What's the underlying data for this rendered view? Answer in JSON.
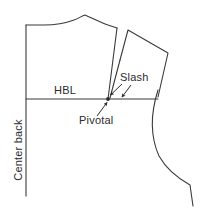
{
  "figure": {
    "type": "technical-pattern-drawing",
    "background_color": "#ffffff",
    "line_color": "#3a3a3a",
    "text_color": "#2b2b2b"
  },
  "labels": {
    "hbl": "HBL",
    "slash": "Slash",
    "pivotal": "Pivotal",
    "center_back": "Center back"
  },
  "geometry": {
    "center_back_line": {
      "x": 26,
      "y_top": 25,
      "y_bottom": 196
    },
    "hbl_line": {
      "y": 99,
      "x_start": 26,
      "x_end": 158
    },
    "pivot_point": {
      "x": 108,
      "y": 99
    },
    "main_piece_outline": "26,99 26,25 44,25 58,24 72,21 85,16 100,22 117,28 108,99",
    "rotated_piece_outline": "128,30 168,53 158,97 120,60",
    "side_seam_path": "158,90 C 150,118 151,140 160,158 C 172,174 182,180 190,185 L 193,205"
  },
  "arrows": [
    {
      "name": "slash-arrow-left",
      "from": [
        121,
        84
      ],
      "to": [
        110,
        95
      ]
    },
    {
      "name": "slash-arrow-right",
      "from": [
        130,
        86
      ],
      "to": [
        121,
        97
      ]
    },
    {
      "name": "pivotal-arrow",
      "from": [
        98,
        116
      ],
      "to": [
        108,
        102
      ]
    }
  ]
}
